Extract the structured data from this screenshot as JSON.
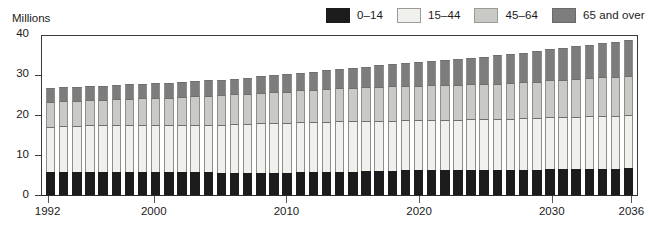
{
  "chart_data": {
    "type": "bar",
    "stacked": true,
    "title": "",
    "subtitle": "",
    "xlabel": "",
    "ylabel": "Millions",
    "ylim": [
      0,
      40
    ],
    "yticks": [
      0,
      10,
      20,
      30,
      40
    ],
    "xtick_labels": [
      "1992",
      "2000",
      "2010",
      "2020",
      "2030",
      "2036"
    ],
    "xtick_years": [
      1992,
      2000,
      2010,
      2020,
      2030,
      2036
    ],
    "grid": false,
    "legend_position": "top-right",
    "categories": [
      "1992",
      "1993",
      "1994",
      "1995",
      "1996",
      "1997",
      "1998",
      "1999",
      "2000",
      "2001",
      "2002",
      "2003",
      "2004",
      "2005",
      "2006",
      "2007",
      "2008",
      "2009",
      "2010",
      "2011",
      "2012",
      "2013",
      "2014",
      "2015",
      "2016",
      "2017",
      "2018",
      "2019",
      "2020",
      "2021",
      "2022",
      "2023",
      "2024",
      "2025",
      "2026",
      "2027",
      "2028",
      "2029",
      "2030",
      "2031",
      "2032",
      "2033",
      "2034",
      "2035",
      "2036"
    ],
    "series": [
      {
        "name": "0–14",
        "color": "#1c1c1c",
        "values": [
          5.6,
          5.7,
          5.7,
          5.8,
          5.8,
          5.8,
          5.8,
          5.8,
          5.8,
          5.7,
          5.7,
          5.6,
          5.6,
          5.5,
          5.5,
          5.5,
          5.5,
          5.5,
          5.5,
          5.6,
          5.6,
          5.7,
          5.8,
          5.8,
          5.9,
          6.0,
          6.0,
          6.1,
          6.1,
          6.2,
          6.2,
          6.2,
          6.3,
          6.3,
          6.3,
          6.3,
          6.3,
          6.3,
          6.4,
          6.4,
          6.4,
          6.5,
          6.5,
          6.5,
          6.6
        ]
      },
      {
        "name": "15–44",
        "color": "#f0f0ec",
        "values": [
          11.4,
          11.5,
          11.5,
          11.5,
          11.5,
          11.5,
          11.5,
          11.5,
          11.6,
          11.6,
          11.7,
          11.8,
          11.9,
          12.0,
          12.1,
          12.2,
          12.3,
          12.4,
          12.4,
          12.5,
          12.5,
          12.5,
          12.5,
          12.5,
          12.5,
          12.5,
          12.5,
          12.5,
          12.5,
          12.5,
          12.5,
          12.5,
          12.5,
          12.6,
          12.6,
          12.7,
          12.8,
          12.9,
          13.0,
          13.0,
          13.1,
          13.1,
          13.2,
          13.2,
          13.3
        ]
      },
      {
        "name": "45–64",
        "color": "#c9c9c5",
        "values": [
          6.0,
          6.1,
          6.2,
          6.3,
          6.4,
          6.5,
          6.6,
          6.7,
          6.8,
          6.9,
          7.0,
          7.1,
          7.2,
          7.3,
          7.4,
          7.5,
          7.6,
          7.7,
          7.8,
          7.9,
          8.0,
          8.1,
          8.2,
          8.3,
          8.4,
          8.4,
          8.5,
          8.5,
          8.6,
          8.6,
          8.6,
          8.7,
          8.7,
          8.7,
          8.8,
          8.8,
          8.9,
          9.0,
          9.1,
          9.2,
          9.3,
          9.4,
          9.5,
          9.6,
          9.7
        ]
      },
      {
        "name": "65 and over",
        "color": "#7d7d7d",
        "values": [
          3.5,
          3.5,
          3.5,
          3.5,
          3.5,
          3.5,
          3.6,
          3.6,
          3.6,
          3.7,
          3.7,
          3.8,
          3.8,
          3.9,
          3.9,
          4.0,
          4.1,
          4.2,
          4.3,
          4.4,
          4.5,
          4.7,
          4.8,
          5.0,
          5.1,
          5.3,
          5.5,
          5.6,
          5.8,
          6.0,
          6.2,
          6.4,
          6.6,
          6.8,
          7.0,
          7.2,
          7.4,
          7.6,
          7.8,
          8.0,
          8.2,
          8.4,
          8.6,
          8.8,
          9.0
        ]
      }
    ],
    "totals": [
      26.5,
      26.8,
      26.9,
      27.1,
      27.2,
      27.3,
      27.5,
      27.6,
      27.8,
      27.9,
      28.1,
      28.3,
      28.5,
      28.7,
      28.9,
      29.2,
      29.5,
      29.8,
      30.0,
      30.4,
      30.6,
      31.0,
      31.3,
      31.6,
      31.9,
      32.2,
      32.5,
      32.7,
      33.0,
      33.3,
      33.5,
      33.8,
      34.1,
      34.4,
      34.7,
      35.0,
      35.4,
      35.8,
      36.3,
      36.6,
      37.0,
      37.4,
      37.8,
      38.1,
      38.6
    ]
  },
  "legend": {
    "items": [
      {
        "label": "0–14",
        "color": "#1c1c1c",
        "border": "#1c1c1c"
      },
      {
        "label": "15–44",
        "color": "#f0f0ec",
        "border": "#9a9a96"
      },
      {
        "label": "45–64",
        "color": "#c9c9c5",
        "border": "#9a9a96"
      },
      {
        "label": "65 and over",
        "color": "#7d7d7d",
        "border": "#6a6a6a"
      }
    ]
  },
  "axis": {
    "y_title": "Millions",
    "y_labels": [
      "40",
      "30",
      "20",
      "10",
      "0"
    ],
    "x_labels": [
      "1992",
      "2000",
      "2010",
      "2020",
      "2030",
      "2036"
    ]
  },
  "colors": {
    "axis": "#3a3a3a",
    "text": "#1a1a1a",
    "background": "#ffffff"
  }
}
